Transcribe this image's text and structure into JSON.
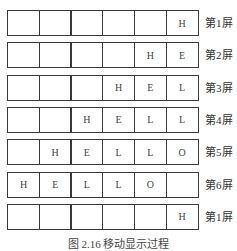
{
  "diagram": {
    "rows": [
      {
        "cells": [
          "",
          "",
          "",
          "",
          "",
          "H"
        ],
        "label": "第1屏"
      },
      {
        "cells": [
          "",
          "",
          "",
          "",
          "H",
          "E"
        ],
        "label": "第2屏"
      },
      {
        "cells": [
          "",
          "",
          "",
          "H",
          "E",
          "L"
        ],
        "label": "第3屏"
      },
      {
        "cells": [
          "",
          "",
          "H",
          "E",
          "L",
          "L"
        ],
        "label": "第4屏"
      },
      {
        "cells": [
          "",
          "H",
          "E",
          "L",
          "L",
          "O"
        ],
        "label": "第5屏"
      },
      {
        "cells": [
          "H",
          "E",
          "L",
          "L",
          "O",
          ""
        ],
        "label": "第6屏"
      },
      {
        "cells": [
          "",
          "",
          "",
          "",
          "",
          "H"
        ],
        "label": "第1屏"
      }
    ],
    "caption": "图 2.16 移动显示过程"
  }
}
